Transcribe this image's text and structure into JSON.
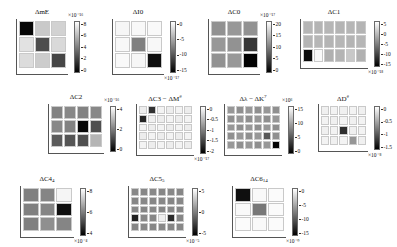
{
  "figure": {
    "kind": "heatmap-grid-figure",
    "panel_count": 11,
    "colormap": "grayscale",
    "background": "#ffffff"
  },
  "chart_data": [
    {
      "type": "heatmap",
      "id": "panel-dmE",
      "title": "ΔmE",
      "rows": 3,
      "cols": 3,
      "exponent": "×10⁻¹⁶",
      "cbar_ticks": [
        "8",
        "6",
        "4",
        "2",
        "0"
      ],
      "cbar_values": [
        8,
        6,
        4,
        2,
        0
      ],
      "vmin": 0,
      "vmax": 8,
      "values": [
        [
          0.2,
          6.3,
          6.6
        ],
        [
          7.1,
          2.4,
          6.8
        ],
        [
          6.9,
          6.4,
          2.2
        ]
      ]
    },
    {
      "type": "heatmap",
      "id": "panel-dI0",
      "title": "ΔI0",
      "rows": 3,
      "cols": 3,
      "exponent": "×10⁻¹⁷",
      "cbar_ticks": [
        "0",
        "-5",
        "-10",
        "-15"
      ],
      "cbar_values": [
        0,
        -5,
        -10,
        -15
      ],
      "vmin": -17,
      "vmax": 0,
      "values": [
        [
          -0.6,
          -0.5,
          -0.4
        ],
        [
          -0.5,
          -8.5,
          -0.5
        ],
        [
          -0.4,
          -0.6,
          -16.0
        ]
      ]
    },
    {
      "type": "heatmap",
      "id": "panel-dC0",
      "title": "ΔC0",
      "rows": 3,
      "cols": 3,
      "exponent": "×10⁻¹⁷",
      "cbar_ticks": [
        "20",
        "15",
        "10",
        "5",
        "0"
      ],
      "cbar_values": [
        20,
        15,
        10,
        5,
        0
      ],
      "vmin": 0,
      "vmax": 21,
      "values": [
        [
          12.0,
          12.5,
          12.0
        ],
        [
          12.5,
          12.0,
          4.5
        ],
        [
          12.0,
          12.5,
          0.2
        ]
      ]
    },
    {
      "type": "heatmap",
      "id": "panel-dC1",
      "title": "ΔC1",
      "rows": 3,
      "cols": 6,
      "exponent": "×10⁻¹⁸",
      "cbar_ticks": [
        "5",
        "0",
        "-5",
        "-10",
        "-15"
      ],
      "cbar_values": [
        5,
        0,
        -5,
        -10,
        -15
      ],
      "vmin": -16,
      "vmax": 5,
      "values": [
        [
          -1.0,
          -1.2,
          -1.0,
          -1.2,
          -1.0,
          -1.2
        ],
        [
          -1.2,
          -1.0,
          -1.2,
          -1.0,
          -1.2,
          -1.0
        ],
        [
          -15.0,
          4.5,
          -1.5,
          -1.2,
          0.5,
          -1.4
        ]
      ]
    },
    {
      "type": "heatmap",
      "id": "panel-dC2",
      "title": "ΔC2",
      "rows": 3,
      "cols": 4,
      "exponent": "×10⁻¹⁶",
      "cbar_ticks": [
        "4",
        "2",
        "0"
      ],
      "cbar_values": [
        4,
        2,
        0
      ],
      "vmin": 0,
      "vmax": 4.5,
      "values": [
        [
          2.3,
          2.4,
          2.3,
          2.4
        ],
        [
          2.4,
          2.3,
          0.1,
          1.4
        ],
        [
          1.6,
          1.5,
          1.4,
          3.2
        ]
      ]
    },
    {
      "type": "heatmap",
      "id": "panel-dC3-dM",
      "title": "ΔC3 − ΔM<sup>#</sup>",
      "title_plain": "ΔC3 − ΔM#",
      "rows": 5,
      "cols": 6,
      "exponent": "×10⁻¹⁷",
      "cbar_ticks": [
        "0",
        "-0.5",
        "-1",
        "-1.5",
        "-2"
      ],
      "cbar_values": [
        0,
        -0.5,
        -1,
        -1.5,
        -2
      ],
      "vmin": -2.1,
      "vmax": 0,
      "values": [
        [
          -0.15,
          -1.7,
          -0.1,
          -0.15,
          -0.1,
          -0.15
        ],
        [
          -1.8,
          -0.12,
          -0.15,
          -0.1,
          -0.15,
          -0.1
        ],
        [
          -0.1,
          -0.15,
          -0.1,
          -0.15,
          -0.1,
          -0.15
        ],
        [
          -0.15,
          -0.1,
          -0.15,
          -0.1,
          -0.15,
          -0.1
        ],
        [
          -0.1,
          -0.15,
          -0.1,
          -0.15,
          -0.1,
          -0.15
        ]
      ]
    },
    {
      "type": "heatmap",
      "id": "panel-dlambda-dK",
      "title": "Δλ − ΔK<sup>7</sup>",
      "title_plain": "Δλ − ΔK7",
      "rows": 5,
      "cols": 6,
      "exponent": "×10⁶",
      "cbar_ticks": [
        "15",
        "10",
        "5",
        "0"
      ],
      "cbar_values": [
        15,
        10,
        5,
        0
      ],
      "vmin": 0,
      "vmax": 16,
      "values": [
        [
          9.5,
          9.0,
          9.5,
          9.0,
          9.5,
          9.0
        ],
        [
          9.0,
          9.5,
          9.0,
          9.5,
          9.0,
          9.5
        ],
        [
          9.5,
          9.0,
          9.5,
          9.0,
          9.5,
          9.0
        ],
        [
          9.0,
          9.5,
          9.0,
          9.5,
          5.5,
          9.0
        ],
        [
          9.5,
          9.0,
          9.5,
          9.0,
          9.5,
          0.2
        ]
      ]
    },
    {
      "type": "heatmap",
      "id": "panel-dD",
      "title": "ΔD<sup>#</sup>",
      "title_plain": "ΔD#",
      "rows": 4,
      "cols": 5,
      "exponent": "×10⁻⁸",
      "cbar_ticks": [
        "0",
        "-0.5",
        "-1",
        "-1.5"
      ],
      "cbar_values": [
        0,
        -0.5,
        -1,
        -1.5
      ],
      "vmin": -1.7,
      "vmax": 0,
      "values": [
        [
          -0.1,
          -0.08,
          -0.1,
          -0.08,
          -0.1
        ],
        [
          -0.08,
          -0.1,
          -0.08,
          -0.1,
          -0.08
        ],
        [
          -0.1,
          -0.08,
          -1.4,
          -0.1,
          -0.08
        ],
        [
          -0.08,
          -0.1,
          -0.08,
          -0.7,
          -0.1
        ]
      ]
    },
    {
      "type": "heatmap",
      "id": "panel-dC4-4",
      "title": "ΔC4<sub>4</sub>",
      "title_plain": "ΔC4_4",
      "rows": 3,
      "cols": 3,
      "exponent": "×10⁻⁴",
      "cbar_ticks": [
        "8",
        "6",
        "4"
      ],
      "cbar_values": [
        8,
        6,
        4
      ],
      "vmin": 3.5,
      "vmax": 8.5,
      "values": [
        [
          6.0,
          6.1,
          8.3
        ],
        [
          6.0,
          6.1,
          3.8
        ],
        [
          6.0,
          6.3,
          6.1
        ]
      ]
    },
    {
      "type": "heatmap",
      "id": "panel-dC5-5",
      "title": "ΔC5<sub>5</sub>",
      "title_plain": "ΔC5_5",
      "rows": 5,
      "cols": 6,
      "exponent": "×10⁻⁵",
      "cbar_ticks": [
        "5",
        "0",
        "-5"
      ],
      "cbar_values": [
        5,
        0,
        -5
      ],
      "vmin": -6,
      "vmax": 6,
      "values": [
        [
          0.4,
          0.3,
          0.4,
          0.3,
          0.4,
          0.3
        ],
        [
          0.3,
          0.4,
          0.3,
          0.4,
          0.3,
          0.4
        ],
        [
          0.4,
          0.3,
          0.4,
          0.3,
          0.4,
          0.3
        ],
        [
          -4.5,
          0.4,
          0.3,
          5.2,
          -4.0,
          0.3
        ],
        [
          0.3,
          0.4,
          0.3,
          0.4,
          0.3,
          0.4
        ]
      ]
    },
    {
      "type": "heatmap",
      "id": "panel-dC6-14",
      "title": "ΔC6<sub>14</sub>",
      "title_plain": "ΔC6_14",
      "rows": 3,
      "cols": 3,
      "exponent": "×10⁻⁹",
      "cbar_ticks": [
        "0",
        "-5",
        "-10",
        "-15"
      ],
      "cbar_values": [
        0,
        -5,
        -10,
        -15
      ],
      "vmin": -17,
      "vmax": 0,
      "values": [
        [
          -16.0,
          -0.4,
          -0.3
        ],
        [
          -0.4,
          -9.0,
          -0.3
        ],
        [
          -0.3,
          -0.4,
          -0.3
        ]
      ]
    }
  ]
}
